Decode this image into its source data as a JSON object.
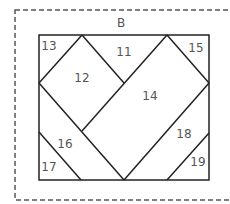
{
  "block_label": "B",
  "pieces": [
    {
      "id": "11",
      "label": "11",
      "x": 124,
      "y": 56
    },
    {
      "id": "12",
      "label": "12",
      "x": 82,
      "y": 82
    },
    {
      "id": "13",
      "label": "13",
      "x": 49,
      "y": 50
    },
    {
      "id": "14",
      "label": "14",
      "x": 150,
      "y": 100
    },
    {
      "id": "15",
      "label": "15",
      "x": 196,
      "y": 52
    },
    {
      "id": "16",
      "label": "16",
      "x": 65,
      "y": 148
    },
    {
      "id": "17",
      "label": "17",
      "x": 49,
      "y": 171
    },
    {
      "id": "18",
      "label": "18",
      "x": 184,
      "y": 138
    },
    {
      "id": "19",
      "label": "19",
      "x": 198,
      "y": 166
    }
  ]
}
